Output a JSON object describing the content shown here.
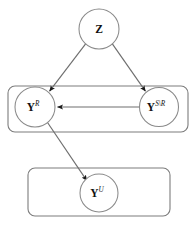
{
  "figure": {
    "type": "probabilistic-graphical-model",
    "title": "",
    "background_color": "#ffffff",
    "width": 195,
    "height": 226
  },
  "style": {
    "node_stroke_color": "#8a8a8a",
    "node_fill_color": "#ffffff",
    "plate_stroke_color": "#7d7d7d",
    "edge_color": "#6e6e6e",
    "arrowhead_color": "#1a1a1a",
    "label_color": "#111111"
  },
  "nodes": [
    {
      "id": "Z",
      "base": "Z",
      "superscript": "",
      "full_label": "Z",
      "cx": 99,
      "cy": 29,
      "r": 20
    },
    {
      "id": "YR",
      "base": "Y",
      "superscript": "R",
      "full_label": "Y^R",
      "cx": 35,
      "cy": 107,
      "r": 20
    },
    {
      "id": "YSR",
      "base": "Y",
      "superscript": "S\\R",
      "full_label": "Y^{S\\R}",
      "cx": 159,
      "cy": 107,
      "r": 19.5
    },
    {
      "id": "YU",
      "base": "Y",
      "superscript": "U",
      "full_label": "Y^U",
      "cx": 99,
      "cy": 193,
      "r": 19
    }
  ],
  "plates": [
    {
      "id": "plate-observed",
      "label": "",
      "x": 8,
      "y": 86,
      "width": 180,
      "height": 46,
      "rx": 7
    },
    {
      "id": "plate-unobserved",
      "label": "",
      "x": 28,
      "y": 168,
      "width": 142,
      "height": 48,
      "rx": 7
    }
  ],
  "edges": [
    {
      "id": "z-to-yr",
      "from": "Z",
      "to": "YR",
      "kind": "directed"
    },
    {
      "id": "z-to-ysr",
      "from": "Z",
      "to": "YSR",
      "kind": "directed"
    },
    {
      "id": "ysr-to-yr",
      "from": "YSR",
      "to": "YR",
      "kind": "directed"
    },
    {
      "id": "yr-to-yu",
      "from": "YR",
      "to": "YU",
      "kind": "directed"
    }
  ]
}
